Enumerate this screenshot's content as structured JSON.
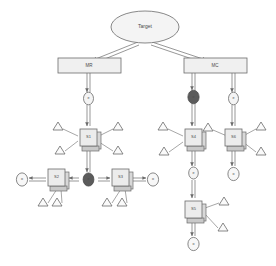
{
  "diagram": {
    "type": "hierarchical-node-graph",
    "colors": {
      "stroke": "#6b6b6b",
      "node_fill": "#ececec",
      "node_shadow": "#c9c9c9",
      "dark_gate_fill": "#5b5b5b",
      "light_gate_fill": "#f4f4f4",
      "bar_fill": "#f0f0f0",
      "text": "#4a4a4a",
      "background": "#ffffff"
    },
    "root": {
      "id": "root",
      "label": "Target",
      "shape": "ellipse"
    },
    "bars": [
      {
        "id": "bar-left",
        "label": "MR",
        "shape": "rectangle"
      },
      {
        "id": "bar-right",
        "label": "MC",
        "shape": "rectangle"
      }
    ],
    "nodes": [
      {
        "id": "s1",
        "label": "S1",
        "shape": "box3d"
      },
      {
        "id": "s2",
        "label": "S2",
        "shape": "box3d"
      },
      {
        "id": "s3",
        "label": "S3",
        "shape": "box3d"
      },
      {
        "id": "s4",
        "label": "S4",
        "shape": "box3d"
      },
      {
        "id": "s5",
        "label": "S5",
        "shape": "box3d"
      },
      {
        "id": "s6",
        "label": "S6",
        "shape": "box3d"
      }
    ],
    "gates": [
      {
        "id": "g1",
        "label": "e",
        "fill": "light"
      },
      {
        "id": "g2",
        "label": "e",
        "fill": "dark"
      },
      {
        "id": "g3",
        "label": "e",
        "fill": "light"
      },
      {
        "id": "g4",
        "label": "e",
        "fill": "dark"
      },
      {
        "id": "g5",
        "label": "e",
        "fill": "light"
      },
      {
        "id": "g6",
        "label": "e",
        "fill": "light"
      },
      {
        "id": "g7",
        "label": "e",
        "fill": "light"
      }
    ],
    "terminals": [
      {
        "id": "t-left",
        "label": "o"
      },
      {
        "id": "t-right",
        "label": "o"
      },
      {
        "id": "t-bottom-mid",
        "label": "o"
      },
      {
        "id": "t-bottom-right",
        "label": "o"
      }
    ],
    "annotations": {
      "glyph": "triangle",
      "count": 16,
      "description": "triangle markers attached to node boxes"
    }
  }
}
